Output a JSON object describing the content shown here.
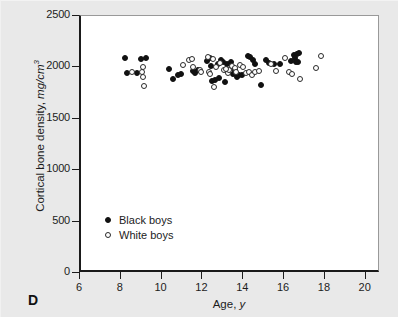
{
  "panel": {
    "label": "D"
  },
  "chart_data": {
    "type": "scatter",
    "title": "",
    "xlabel": "Age, y",
    "ylabel": "Cortical bone density, mg/cm3",
    "ylabel_prefix": "Cortical bone density, ",
    "ylabel_units_base": "mg/cm",
    "ylabel_units_exp": "3",
    "xlabel_prefix": "Age, ",
    "xlabel_italic": "y",
    "xlim": [
      6,
      20.7
    ],
    "ylim": [
      0,
      2500
    ],
    "xticks": [
      6,
      8,
      10,
      12,
      14,
      16,
      18,
      20
    ],
    "xtick_labels": [
      "6",
      "8",
      "10",
      "12",
      "14",
      "16",
      "18",
      "20"
    ],
    "yticks": [
      0,
      500,
      1000,
      1500,
      2000,
      2500
    ],
    "ytick_labels": [
      "0",
      "500",
      "1000",
      "1500",
      "2000",
      "2500"
    ],
    "grid": false,
    "legend_position": "inside-lower-left",
    "series": [
      {
        "name": "Black boys",
        "marker": "filled-circle",
        "color": "#111111",
        "points": [
          [
            8.15,
            2090
          ],
          [
            8.25,
            1945
          ],
          [
            8.95,
            2085
          ],
          [
            9.2,
            2090
          ],
          [
            8.75,
            1950
          ],
          [
            10.3,
            1980
          ],
          [
            10.5,
            1890
          ],
          [
            10.75,
            1925
          ],
          [
            10.9,
            1935
          ],
          [
            11.5,
            1965
          ],
          [
            11.6,
            1945
          ],
          [
            11.75,
            1975
          ],
          [
            12.15,
            2065
          ],
          [
            12.3,
            2090
          ],
          [
            12.35,
            2015
          ],
          [
            12.4,
            1870
          ],
          [
            12.55,
            1880
          ],
          [
            12.7,
            2035
          ],
          [
            12.75,
            1900
          ],
          [
            12.85,
            2070
          ],
          [
            12.95,
            2050
          ],
          [
            13.05,
            1855
          ],
          [
            13.15,
            2030
          ],
          [
            13.35,
            2055
          ],
          [
            13.45,
            1935
          ],
          [
            13.55,
            1975
          ],
          [
            13.65,
            1905
          ],
          [
            13.75,
            1930
          ],
          [
            13.9,
            1930
          ],
          [
            14.2,
            2110
          ],
          [
            14.3,
            2105
          ],
          [
            14.45,
            2075
          ],
          [
            14.55,
            2035
          ],
          [
            14.8,
            1830
          ],
          [
            15.05,
            2075
          ],
          [
            15.2,
            2040
          ],
          [
            15.45,
            2030
          ],
          [
            15.75,
            2030
          ],
          [
            16.3,
            2065
          ],
          [
            16.45,
            2125
          ],
          [
            16.5,
            2095
          ],
          [
            16.6,
            2135
          ],
          [
            16.7,
            2140
          ],
          [
            16.65,
            2055
          ],
          [
            16.55,
            2050
          ]
        ]
      },
      {
        "name": "White boys",
        "marker": "open-circle",
        "color": "#ffffff",
        "points": [
          [
            8.5,
            1955
          ],
          [
            9.05,
            2000
          ],
          [
            9.05,
            1905
          ],
          [
            9.1,
            1820
          ],
          [
            9.0,
            1955
          ],
          [
            11.0,
            2025
          ],
          [
            11.3,
            2070
          ],
          [
            11.45,
            2085
          ],
          [
            11.5,
            2000
          ],
          [
            11.85,
            1970
          ],
          [
            11.9,
            1960
          ],
          [
            12.2,
            2105
          ],
          [
            12.25,
            1960
          ],
          [
            12.3,
            1935
          ],
          [
            12.5,
            1805
          ],
          [
            12.6,
            2000
          ],
          [
            12.8,
            2045
          ],
          [
            13.0,
            1970
          ],
          [
            13.2,
            1945
          ],
          [
            13.25,
            1975
          ],
          [
            13.4,
            2010
          ],
          [
            13.55,
            1995
          ],
          [
            13.6,
            1955
          ],
          [
            13.8,
            2020
          ],
          [
            13.95,
            2005
          ],
          [
            14.1,
            1945
          ],
          [
            14.25,
            1960
          ],
          [
            14.4,
            1930
          ],
          [
            14.55,
            1955
          ],
          [
            14.7,
            1965
          ],
          [
            15.3,
            2030
          ],
          [
            15.55,
            1965
          ],
          [
            16.0,
            2090
          ],
          [
            16.2,
            1955
          ],
          [
            16.35,
            1940
          ],
          [
            16.75,
            1885
          ],
          [
            17.5,
            1995
          ],
          [
            17.75,
            2115
          ],
          [
            12.45,
            2085
          ],
          [
            13.1,
            1980
          ]
        ]
      }
    ]
  },
  "legend": {
    "items": [
      {
        "label": "Black boys",
        "marker": "filled-circle"
      },
      {
        "label": "White boys",
        "marker": "open-circle"
      }
    ]
  },
  "colors": {
    "background": "#e9e9e9",
    "plot_background": "#ffffff",
    "axis": "#1c1c1c",
    "frame": "#999999",
    "black_marker": "#111111",
    "white_marker": "#ffffff"
  }
}
